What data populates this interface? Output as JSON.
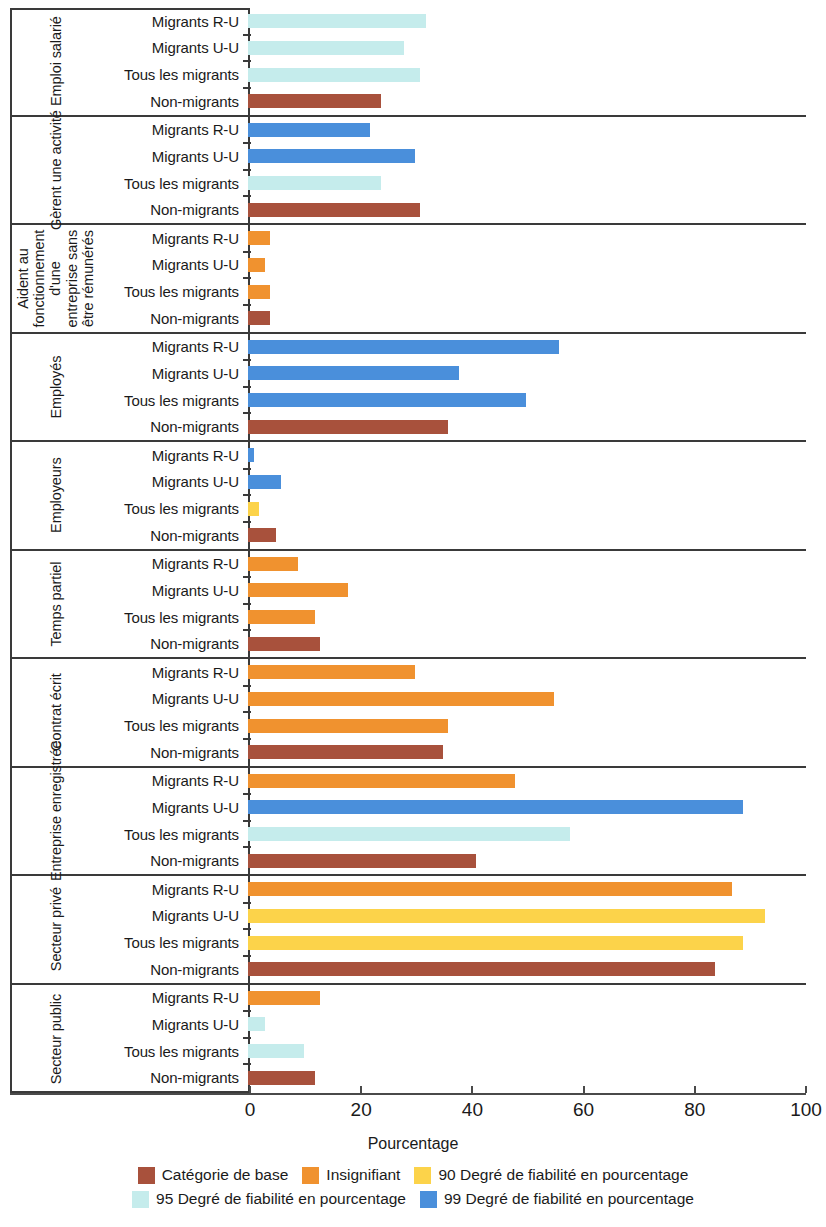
{
  "chart_data": {
    "type": "bar",
    "orientation": "horizontal",
    "title": "",
    "xlabel": "Pourcentage",
    "ylabel": "",
    "xlim": [
      0,
      100
    ],
    "xticks": [
      0,
      20,
      40,
      60,
      80,
      100
    ],
    "xtick_labels": [
      "0",
      "20",
      "40",
      "60",
      "80",
      "100"
    ],
    "grid": false,
    "legend_position": "bottom",
    "categories": [
      "Migrants R-U",
      "Migrants U-U",
      "Tous les migrants",
      "Non-migrants"
    ],
    "legend": [
      {
        "label": "Catégorie de base",
        "color": "#a8513c",
        "key": "base"
      },
      {
        "label": "Insignifiant",
        "color": "#f0922f",
        "key": "insignificant"
      },
      {
        "label": "90 Degré de fiabilité en pourcentage",
        "color": "#fcd34a",
        "key": "conf90"
      },
      {
        "label": "95 Degré de fiabilité en pourcentage",
        "color": "#c5ecec",
        "key": "conf95"
      },
      {
        "label": "99 Degré de fiabilité en pourcentage",
        "color": "#4a8fdb",
        "key": "conf99"
      }
    ],
    "groups": [
      {
        "label": "Emploi salarié",
        "label_style": "single",
        "bars": [
          {
            "category": "Migrants R-U",
            "value": 32,
            "color_key": "conf95"
          },
          {
            "category": "Migrants U-U",
            "value": 28,
            "color_key": "conf95"
          },
          {
            "category": "Tous les migrants",
            "value": 31,
            "color_key": "conf95"
          },
          {
            "category": "Non-migrants",
            "value": 24,
            "color_key": "base"
          }
        ]
      },
      {
        "label": "Gèrent une activité",
        "label_style": "wide",
        "bars": [
          {
            "category": "Migrants R-U",
            "value": 22,
            "color_key": "conf99"
          },
          {
            "category": "Migrants U-U",
            "value": 30,
            "color_key": "conf99"
          },
          {
            "category": "Tous les migrants",
            "value": 24,
            "color_key": "conf95"
          },
          {
            "category": "Non-migrants",
            "value": 31,
            "color_key": "base"
          }
        ]
      },
      {
        "label": "Aident au fonctionnement d'une entreprise sans être rémunérés",
        "label_style": "multi",
        "bars": [
          {
            "category": "Migrants R-U",
            "value": 4,
            "color_key": "insignificant"
          },
          {
            "category": "Migrants U-U",
            "value": 3,
            "color_key": "insignificant"
          },
          {
            "category": "Tous les migrants",
            "value": 4,
            "color_key": "insignificant"
          },
          {
            "category": "Non-migrants",
            "value": 4,
            "color_key": "base"
          }
        ]
      },
      {
        "label": "Employés",
        "label_style": "single",
        "bars": [
          {
            "category": "Migrants R-U",
            "value": 56,
            "color_key": "conf99"
          },
          {
            "category": "Migrants U-U",
            "value": 38,
            "color_key": "conf99"
          },
          {
            "category": "Tous les migrants",
            "value": 50,
            "color_key": "conf99"
          },
          {
            "category": "Non-migrants",
            "value": 36,
            "color_key": "base"
          }
        ]
      },
      {
        "label": "Employeurs",
        "label_style": "single",
        "bars": [
          {
            "category": "Migrants R-U",
            "value": 1,
            "color_key": "conf99"
          },
          {
            "category": "Migrants U-U",
            "value": 6,
            "color_key": "conf99"
          },
          {
            "category": "Tous les migrants",
            "value": 2,
            "color_key": "conf90"
          },
          {
            "category": "Non-migrants",
            "value": 5,
            "color_key": "base"
          }
        ]
      },
      {
        "label": "Temps partiel",
        "label_style": "single",
        "bars": [
          {
            "category": "Migrants R-U",
            "value": 9,
            "color_key": "insignificant"
          },
          {
            "category": "Migrants U-U",
            "value": 18,
            "color_key": "insignificant"
          },
          {
            "category": "Tous les migrants",
            "value": 12,
            "color_key": "insignificant"
          },
          {
            "category": "Non-migrants",
            "value": 13,
            "color_key": "base"
          }
        ]
      },
      {
        "label": "Contrat écrit",
        "label_style": "single",
        "bars": [
          {
            "category": "Migrants R-U",
            "value": 30,
            "color_key": "insignificant"
          },
          {
            "category": "Migrants U-U",
            "value": 55,
            "color_key": "insignificant"
          },
          {
            "category": "Tous les migrants",
            "value": 36,
            "color_key": "insignificant"
          },
          {
            "category": "Non-migrants",
            "value": 35,
            "color_key": "base"
          }
        ]
      },
      {
        "label": "Entreprise enregistrée",
        "label_style": "wide",
        "bars": [
          {
            "category": "Migrants R-U",
            "value": 48,
            "color_key": "insignificant"
          },
          {
            "category": "Migrants U-U",
            "value": 89,
            "color_key": "conf99"
          },
          {
            "category": "Tous les migrants",
            "value": 58,
            "color_key": "conf95"
          },
          {
            "category": "Non-migrants",
            "value": 41,
            "color_key": "base"
          }
        ]
      },
      {
        "label": "Secteur privé",
        "label_style": "single",
        "bars": [
          {
            "category": "Migrants R-U",
            "value": 87,
            "color_key": "insignificant"
          },
          {
            "category": "Migrants U-U",
            "value": 93,
            "color_key": "conf90"
          },
          {
            "category": "Tous les migrants",
            "value": 89,
            "color_key": "conf90"
          },
          {
            "category": "Non-migrants",
            "value": 84,
            "color_key": "base"
          }
        ]
      },
      {
        "label": "Secteur public",
        "label_style": "single",
        "bars": [
          {
            "category": "Migrants R-U",
            "value": 13,
            "color_key": "insignificant"
          },
          {
            "category": "Migrants U-U",
            "value": 3,
            "color_key": "conf95"
          },
          {
            "category": "Tous les migrants",
            "value": 10,
            "color_key": "conf95"
          },
          {
            "category": "Non-migrants",
            "value": 12,
            "color_key": "base"
          }
        ]
      }
    ]
  }
}
